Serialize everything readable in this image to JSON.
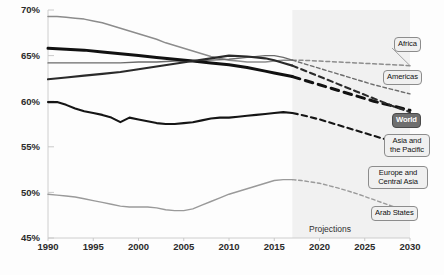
{
  "chart_data": {
    "type": "line",
    "title": "",
    "subtitle": "",
    "xlabel": "",
    "ylabel": "",
    "xlim": [
      1990,
      2030
    ],
    "ylim": [
      45,
      70
    ],
    "y_tick_labels": [
      "70%",
      "65%",
      "60%",
      "55%",
      "50%",
      "45%"
    ],
    "y_ticks": [
      70,
      65,
      60,
      55,
      50,
      45
    ],
    "x_ticks": [
      1990,
      1995,
      2000,
      2005,
      2010,
      2015,
      2020,
      2025,
      2030
    ],
    "x_tick_labels": [
      "1990",
      "1995",
      "2000",
      "2005",
      "2010",
      "2015",
      "2020",
      "2025",
      "2030"
    ],
    "grid": false,
    "legend_position": "right-callouts",
    "projection_start_year": 2017,
    "projection_band_label": "Projections",
    "series": [
      {
        "name": "Africa",
        "color": "#8c8c8c",
        "style": "line-then-dashed",
        "x": [
          1990,
          1991,
          1992,
          1993,
          1994,
          1995,
          1996,
          1997,
          1998,
          1999,
          2000,
          2001,
          2002,
          2003,
          2004,
          2005,
          2006,
          2007,
          2008,
          2009,
          2010,
          2011,
          2012,
          2013,
          2014,
          2015,
          2016,
          2017,
          2018,
          2020,
          2022,
          2024,
          2026,
          2028,
          2030
        ],
        "values": [
          69.3,
          69.3,
          69.2,
          69.1,
          69.0,
          68.8,
          68.6,
          68.3,
          68.0,
          67.7,
          67.4,
          67.1,
          66.8,
          66.4,
          66.1,
          65.8,
          65.5,
          65.2,
          64.9,
          64.7,
          64.5,
          64.4,
          64.3,
          64.3,
          64.3,
          64.4,
          64.5,
          64.5,
          64.5,
          64.4,
          64.3,
          64.2,
          64.1,
          64.0,
          63.9
        ]
      },
      {
        "name": "Americas",
        "color": "#6b6b6b",
        "style": "line-then-dashed",
        "x": [
          1990,
          1992,
          1994,
          1996,
          1998,
          2000,
          2002,
          2004,
          2006,
          2008,
          2010,
          2012,
          2014,
          2015,
          2016,
          2017,
          2018,
          2020,
          2022,
          2024,
          2026,
          2028,
          2030
        ],
        "values": [
          64.2,
          64.2,
          64.2,
          64.2,
          64.2,
          64.3,
          64.3,
          64.4,
          64.4,
          64.5,
          64.6,
          64.8,
          65.0,
          65.0,
          64.8,
          64.5,
          64.2,
          63.6,
          63.0,
          62.4,
          61.8,
          61.3,
          60.8
        ]
      },
      {
        "name": "World",
        "color": "#111111",
        "style": "line-then-dashed",
        "x": [
          1990,
          1992,
          1994,
          1996,
          1998,
          2000,
          2002,
          2004,
          2006,
          2008,
          2010,
          2012,
          2014,
          2015,
          2016,
          2017,
          2018,
          2020,
          2022,
          2024,
          2026,
          2028,
          2030
        ],
        "values": [
          65.8,
          65.7,
          65.6,
          65.4,
          65.2,
          65.0,
          64.8,
          64.6,
          64.4,
          64.2,
          64.0,
          63.7,
          63.3,
          63.1,
          62.9,
          62.7,
          62.4,
          61.8,
          61.2,
          60.6,
          60.0,
          59.5,
          59.0
        ]
      },
      {
        "name": "Asia and the Pacific",
        "color": "#2a2a2a",
        "style": "line-then-dashed",
        "x": [
          1990,
          1992,
          1994,
          1996,
          1998,
          2000,
          2002,
          2004,
          2006,
          2008,
          2010,
          2012,
          2014,
          2015,
          2016,
          2017,
          2018,
          2020,
          2022,
          2024,
          2026,
          2028,
          2030
        ],
        "values": [
          62.4,
          62.6,
          62.8,
          63.0,
          63.2,
          63.5,
          63.8,
          64.1,
          64.4,
          64.7,
          65.0,
          64.9,
          64.7,
          64.5,
          64.2,
          63.9,
          63.5,
          62.7,
          61.9,
          61.1,
          60.3,
          59.5,
          58.8
        ]
      },
      {
        "name": "Europe and Central Asia",
        "color": "#151515",
        "style": "line-then-dashed",
        "x": [
          1990,
          1991,
          1992,
          1993,
          1994,
          1995,
          1996,
          1997,
          1998,
          1999,
          2000,
          2001,
          2002,
          2003,
          2004,
          2005,
          2006,
          2007,
          2008,
          2009,
          2010,
          2011,
          2012,
          2013,
          2014,
          2015,
          2016,
          2017,
          2018,
          2020,
          2022,
          2024,
          2026,
          2028,
          2030
        ],
        "values": [
          59.9,
          59.9,
          59.6,
          59.2,
          58.9,
          58.7,
          58.5,
          58.2,
          57.7,
          58.2,
          58.0,
          57.8,
          57.6,
          57.5,
          57.5,
          57.6,
          57.7,
          57.9,
          58.1,
          58.2,
          58.2,
          58.3,
          58.4,
          58.5,
          58.6,
          58.7,
          58.8,
          58.7,
          58.5,
          58.0,
          57.4,
          56.8,
          56.2,
          55.6,
          55.0
        ]
      },
      {
        "name": "Arab States",
        "color": "#9a9a9a",
        "style": "line-then-dashed",
        "x": [
          1990,
          1991,
          1992,
          1993,
          1994,
          1995,
          1996,
          1997,
          1998,
          1999,
          2000,
          2001,
          2002,
          2003,
          2004,
          2005,
          2006,
          2007,
          2008,
          2009,
          2010,
          2011,
          2012,
          2013,
          2014,
          2015,
          2016,
          2017,
          2018,
          2020,
          2022,
          2024,
          2026,
          2028,
          2030
        ],
        "values": [
          49.8,
          49.7,
          49.6,
          49.5,
          49.3,
          49.1,
          48.9,
          48.7,
          48.5,
          48.4,
          48.4,
          48.4,
          48.3,
          48.1,
          48.0,
          48.0,
          48.2,
          48.6,
          49.0,
          49.4,
          49.8,
          50.1,
          50.4,
          50.7,
          51.0,
          51.3,
          51.4,
          51.4,
          51.3,
          51.0,
          50.5,
          49.9,
          49.2,
          48.5,
          47.8
        ]
      }
    ],
    "callouts": [
      {
        "label": "Africa",
        "highlight": false
      },
      {
        "label": "Americas",
        "highlight": false
      },
      {
        "label": "World",
        "highlight": true
      },
      {
        "label": "Asia and the Pacific",
        "highlight": false
      },
      {
        "label": "Europe and Central Asia",
        "highlight": false
      },
      {
        "label": "Arab States",
        "highlight": false
      }
    ]
  },
  "colors": {
    "projection_band": "#efefef",
    "axis_text": "#2b2b2b",
    "callout_fill": "#f0f0f0",
    "callout_highlight_fill": "#6f6f6f",
    "callout_border": "#8c8c8c"
  }
}
